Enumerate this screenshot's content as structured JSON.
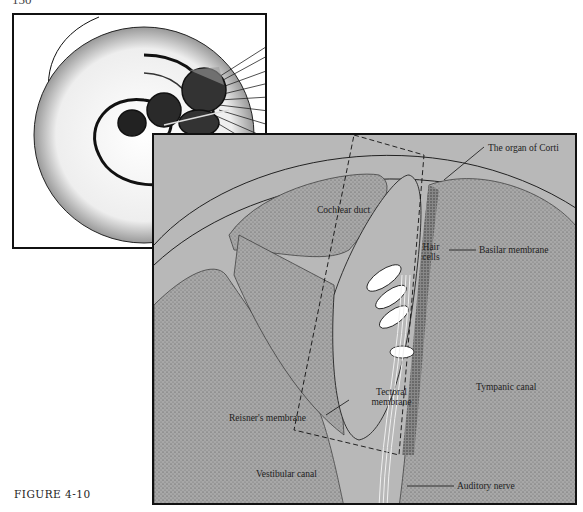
{
  "page": {
    "page_number": "150",
    "caption": "FIGURE 4-10"
  },
  "inset": {
    "description": "Cochlea spiral cross-section overview"
  },
  "main_diagram": {
    "labels": {
      "organ_of_corti": "The organ of Corti",
      "cochlear_duct": "Cochlear duct",
      "hair_cells_line1": "Hair",
      "hair_cells_line2": "cells",
      "basilar_membrane": "Basilar membrane",
      "tectoral_line1": "Tectoral",
      "tectoral_line2": "membrane",
      "reisners_membrane": "Reisner's membrane",
      "tympanic_canal": "Tympanic canal",
      "vestibular_canal": "Vestibular canal",
      "auditory_nerve": "Auditory nerve"
    },
    "colors": {
      "background": "#b8b8b8",
      "stipple": "#555555",
      "outline": "#111111",
      "hair_cell": "#ffffff"
    }
  }
}
